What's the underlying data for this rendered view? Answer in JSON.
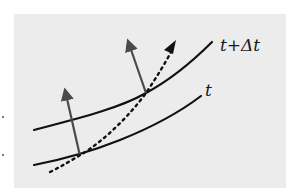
{
  "figure": {
    "background_color": "#ececec",
    "curves": [
      {
        "name": "wavefront-t-plus-dt",
        "label": "t+Δt",
        "color": "#111111"
      },
      {
        "name": "wavefront-t",
        "label": "t",
        "color": "#111111"
      }
    ],
    "arrows": [
      {
        "name": "normal-arrow-lower",
        "color": "#4a4a4a"
      },
      {
        "name": "normal-arrow-upper",
        "color": "#4a4a4a"
      }
    ],
    "ray": {
      "name": "dotted-ray",
      "style": "dotted",
      "color": "#111111"
    }
  },
  "labels": {
    "upper": "t+Δt",
    "lower": "t"
  }
}
